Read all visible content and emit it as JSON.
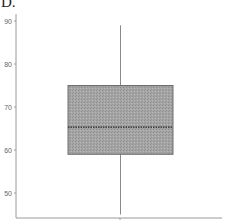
{
  "panel_label": "D.",
  "colors": {
    "axis": "#9a9a9a",
    "box_fill": "#a3a3a3",
    "box_stroke": "#6e6e6e",
    "median": "#222222",
    "whisker": "#8a8a8a"
  },
  "chart_data": {
    "type": "box",
    "title": "",
    "xlabel": "",
    "ylabel": "",
    "ylim": [
      44,
      91
    ],
    "yticks": [
      50,
      60,
      70,
      80,
      90
    ],
    "ytick_labels": [
      "50",
      "60",
      "70",
      "80",
      "90"
    ],
    "grid": false,
    "legend": null,
    "series": [
      {
        "name": "",
        "whisker_low": 45,
        "q1": 59,
        "median": 65.3,
        "q3": 75,
        "whisker_high": 89
      }
    ]
  }
}
